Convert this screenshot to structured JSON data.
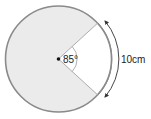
{
  "diagram": {
    "type": "circle-sector",
    "angle_label": "85°",
    "angle_degrees": 85,
    "arc_length_label": "10cm",
    "colors": {
      "shaded": "#ebebeb",
      "outline": "#8a8a8a",
      "sector_unshaded": "#ffffff",
      "line": "#9a9a9a",
      "text": "#222222"
    }
  }
}
